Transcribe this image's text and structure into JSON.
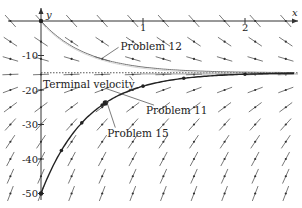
{
  "chart_data": {
    "type": "line",
    "title": "",
    "xlabel": "x",
    "ylabel": "y",
    "xlim": [
      0,
      2.5
    ],
    "ylim": [
      -50,
      0
    ],
    "x_ticks": [
      {
        "value": 1,
        "label": "1"
      },
      {
        "value": 2,
        "label": "2"
      }
    ],
    "y_ticks": [
      {
        "value": -10,
        "label": "-10"
      },
      {
        "value": -20,
        "label": "-20"
      },
      {
        "value": -30,
        "label": "-30"
      },
      {
        "value": -40,
        "label": "-40"
      },
      {
        "value": -50,
        "label": "-50"
      }
    ],
    "grid": false,
    "direction_field": {
      "equation": "dy/dx = k (y_T - y)",
      "k": 2.2,
      "y_T": -15
    },
    "series": [
      {
        "name": "Problem 12",
        "initial": [
          0,
          0
        ],
        "style": "thin gray",
        "color": "#666666"
      },
      {
        "name": "Problem 15",
        "initial": [
          0,
          -50
        ],
        "style": "thick",
        "color": "#222222",
        "points": [
          [
            0,
            -50
          ],
          [
            0.2,
            -31
          ],
          [
            0.4,
            -23.5
          ],
          [
            0.6,
            -20
          ],
          [
            1.0,
            -17
          ],
          [
            1.4,
            -16
          ],
          [
            2.0,
            -15.3
          ]
        ]
      },
      {
        "name": "Problem 11",
        "point": [
          0.63,
          -19.5
        ],
        "color": "#222222"
      },
      {
        "name": "Terminal velocity",
        "y": -15,
        "style": "dotted",
        "color": "#444444"
      }
    ],
    "annotations": [
      {
        "text": "Problem 12",
        "x": 0.78,
        "y": -8.5,
        "arrow_to": [
          0.6,
          -10.8
        ]
      },
      {
        "text": "Terminal velocity",
        "x": 0.02,
        "y": -19.5,
        "arrow_to": [
          0.87,
          -16
        ]
      },
      {
        "text": "Problem 11",
        "x": 1.03,
        "y": -27,
        "arrow_to": [
          0.63,
          -19.5
        ]
      },
      {
        "text": "Problem 15",
        "x": 0.65,
        "y": -33.5,
        "arrow_to": [
          0.64,
          -23
        ]
      }
    ]
  }
}
